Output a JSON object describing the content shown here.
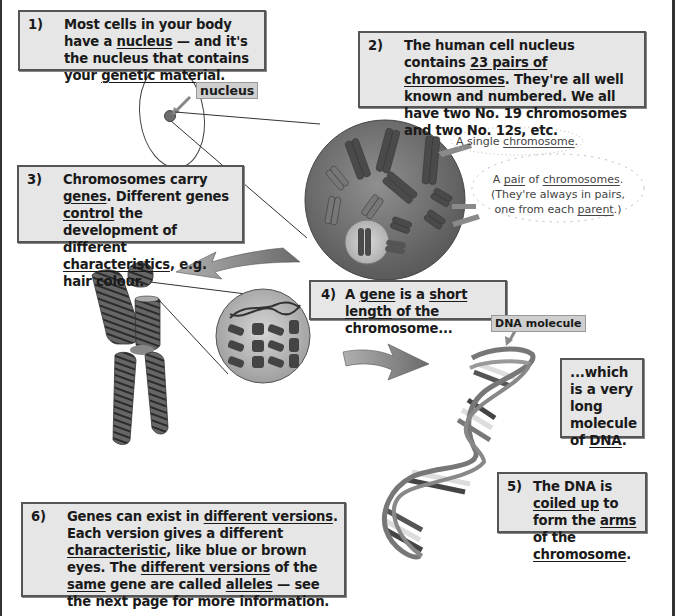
{
  "boxes": {
    "b1": {
      "num": "1)",
      "parts": [
        "Most cells in your body have a ",
        "nucleus",
        " — and it's the nucleus that contains your ",
        "genetic material",
        "."
      ]
    },
    "b2": {
      "num": "2)",
      "parts": [
        "The human cell nucleus contains ",
        "23 pairs of chromosomes",
        ". They're all well known and numbered. We all have two No. 19 chromosomes and two No. 12s, etc."
      ]
    },
    "b3": {
      "num": "3)",
      "parts": [
        "Chromosomes carry ",
        "genes",
        ". Different genes ",
        "control",
        " the development of different ",
        "characteristics",
        ", e.g. hair colour."
      ]
    },
    "b4": {
      "num": "4)",
      "parts": [
        "A ",
        "gene",
        " is a ",
        "short length",
        " of the chromosome..."
      ]
    },
    "bdna": {
      "parts": [
        "...which is a very long molecule of ",
        "DNA",
        "."
      ]
    },
    "b5": {
      "num": "5)",
      "parts": [
        "The DNA is ",
        "coiled up",
        " to form the ",
        "arms",
        " of the ",
        "chromosome",
        "."
      ]
    },
    "b6": {
      "num": "6)",
      "parts": [
        "Genes can exist in ",
        "different versions",
        ". Each version gives a different ",
        "characteristic",
        ", like blue or brown eyes. The ",
        "different versions",
        " of the ",
        "same",
        " gene are called ",
        "alleles",
        " — see the next page for more information."
      ]
    }
  },
  "tags": {
    "nucleus": "nucleus",
    "dna_molecule": "DNA molecule"
  },
  "callouts": {
    "single": {
      "parts": [
        "A single ",
        "chromosome",
        "."
      ]
    },
    "pair": {
      "parts": [
        "A ",
        "pair",
        " of ",
        "chromosomes",
        ". (They're always in pairs, one from each ",
        "parent",
        ".)"
      ]
    }
  },
  "colors": {
    "box_fill": "#e6e6e6",
    "box_border": "#555555",
    "nucleus_fill": "#6e6e6e",
    "arrow_fill": "#8a8a8a"
  }
}
